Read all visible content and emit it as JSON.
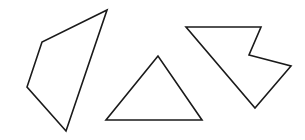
{
  "canvas": {
    "width": 305,
    "height": 140,
    "background": "#ffffff",
    "stroke": "#1a1a1a"
  },
  "shapes": [
    {
      "name": "quadrilateral",
      "points": "107,10 42,42 27,87 66,131"
    },
    {
      "name": "triangle",
      "points": "158,56 106,120 202,120"
    },
    {
      "name": "concave-pentagon",
      "points": "186,27 261,27 249,55 291,66 255,108"
    }
  ]
}
